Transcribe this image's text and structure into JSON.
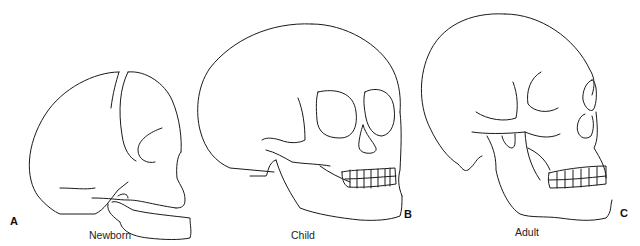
{
  "figure": {
    "panels": [
      {
        "letter": "A",
        "caption": "Newborn"
      },
      {
        "letter": "B",
        "caption": "Child"
      },
      {
        "letter": "C",
        "caption": "Adult"
      }
    ]
  }
}
